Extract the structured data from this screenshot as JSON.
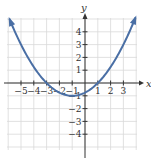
{
  "chart_data": {
    "type": "line",
    "title": "",
    "xlabel": "x",
    "ylabel": "y",
    "xlim": [
      -6,
      4
    ],
    "ylim": [
      -5,
      5
    ],
    "grid": true,
    "x_ticks": [
      -5,
      -4,
      -3,
      -2,
      -1,
      1,
      2,
      3
    ],
    "y_ticks": [
      -4,
      -3,
      -2,
      -1,
      1,
      2,
      3,
      4
    ],
    "x_tick_labels": [
      "−5",
      "−4",
      "−3",
      "−2",
      "−1",
      "1",
      "2",
      "3"
    ],
    "y_tick_labels": [
      "−4",
      "−3",
      "−2",
      "−1",
      "1",
      "2",
      "3",
      "4"
    ],
    "series": [
      {
        "name": "parabola",
        "equation": "y = (1/4)(x + 1)^2 − 1",
        "x": [
          -5.9,
          -5,
          -4,
          -3,
          -2,
          -1,
          0,
          1,
          2,
          3,
          4
        ],
        "y": [
          5.0,
          3.0,
          1.25,
          0,
          -0.75,
          -1,
          -0.75,
          0,
          1.25,
          3,
          5.25
        ],
        "color": "#4a6fa5",
        "arrows_at_ends": true
      }
    ],
    "key_points": {
      "vertex": [
        -1,
        -1
      ],
      "x_intercepts": [
        -3,
        1
      ],
      "y_intercept": -0.75
    }
  },
  "colors": {
    "curve": "#4a6fa5",
    "grid": "#d9d9d9",
    "axis": "#333333"
  }
}
